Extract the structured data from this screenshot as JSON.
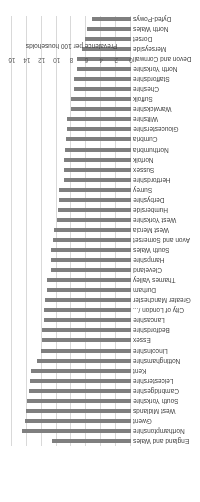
{
  "chart_data": {
    "type": "bar",
    "orientation": "horizontal",
    "rotation_deg": 180,
    "title": "",
    "xlabel": "Prevalence per 100 households",
    "ylabel": "",
    "xlim": [
      0,
      16
    ],
    "xticks": [
      0,
      2,
      4,
      6,
      8,
      10,
      12,
      14,
      16
    ],
    "grid": true,
    "legend": null,
    "bar_color": "#7f7f7f",
    "categories": [
      "England and Wales",
      "Northamptonshire",
      "Gwent",
      "West Midlands",
      "South Yorkshire",
      "Cambridgeshire",
      "Leicestershire",
      "Kent",
      "Nottinghamshire",
      "Lincolnshire",
      "Essex",
      "Bedfordshire",
      "Lancashire",
      "City of London /...",
      "Greater Manchester",
      "Durham",
      "Thames Valley",
      "Cleveland",
      "Hampshire",
      "South Wales",
      "Avon and Somerset",
      "West Mercia",
      "West Yorkshire",
      "Humberside",
      "Derbyshire",
      "Surrey",
      "Hertfordshire",
      "Sussex",
      "Norfolk",
      "Northumbria",
      "Cumbria",
      "Gloucestershire",
      "Wiltshire",
      "Warwickshire",
      "Suffolk",
      "Cheshire",
      "Staffordshire",
      "North Yorkshire",
      "Devon and Cornwall",
      "Merseyside",
      "Dorset",
      "North Wales",
      "Dyfed-Powys"
    ],
    "values": [
      10.6,
      14.6,
      14.3,
      14.1,
      14.0,
      13.7,
      13.6,
      13.5,
      12.7,
      12.1,
      12.0,
      12.0,
      11.7,
      11.7,
      11.6,
      11.3,
      11.3,
      10.8,
      10.7,
      10.7,
      10.5,
      10.3,
      9.9,
      9.8,
      9.7,
      9.7,
      9.0,
      9.0,
      9.0,
      8.9,
      8.7,
      8.6,
      8.6,
      8.0,
      8.0,
      7.6,
      7.6,
      7.2,
      7.2,
      6.6,
      6.2,
      5.9,
      5.3
    ]
  }
}
